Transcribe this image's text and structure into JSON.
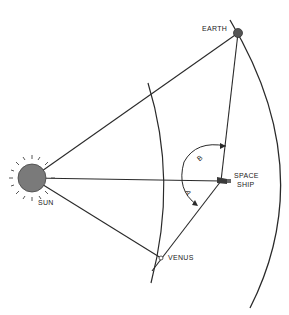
{
  "diagram": {
    "type": "orbital geometry",
    "labels": {
      "sun": "SUN",
      "earth": "EARTH",
      "venus": "VENUS",
      "spaceship_line1": "SPACE",
      "spaceship_line2": "SHIP",
      "angle_a": "A",
      "angle_b": "B"
    },
    "bodies": [
      {
        "name": "Sun",
        "x": 32,
        "y": 178
      },
      {
        "name": "Earth",
        "x": 238,
        "y": 33
      },
      {
        "name": "Venus",
        "x": 161,
        "y": 258
      },
      {
        "name": "Space Ship",
        "x": 221,
        "y": 181
      }
    ],
    "lines": [
      {
        "from": "Sun",
        "to": "Earth"
      },
      {
        "from": "Sun",
        "to": "Space Ship"
      },
      {
        "from": "Sun",
        "to": "Venus"
      },
      {
        "from": "Space Ship",
        "to": "Earth"
      },
      {
        "from": "Space Ship",
        "to": "Venus"
      }
    ],
    "orbits": [
      "Venus orbit",
      "Earth orbit"
    ],
    "colors": {
      "line": "#2a2a2a",
      "sun_fill": "#7a7a7a",
      "earth_fill": "#555555"
    }
  }
}
